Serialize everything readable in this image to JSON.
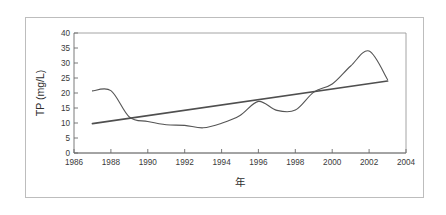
{
  "figure": {
    "frame_color": "#bdbdbd",
    "background": "#ffffff"
  },
  "chart_data": {
    "type": "line",
    "title": "",
    "subtitle": "",
    "xlabel": "年",
    "ylabel": "TP (mg/L)",
    "xlim": [
      1986,
      2004
    ],
    "ylim": [
      0,
      40
    ],
    "xticks": [
      1986,
      1988,
      1990,
      1992,
      1994,
      1996,
      1998,
      2000,
      2002,
      2004
    ],
    "xtick_labels": [
      "1986",
      "1988",
      "1990",
      "1992",
      "1994",
      "1996",
      "1998",
      "2000",
      "2002",
      "2004"
    ],
    "yticks": [
      0,
      5,
      10,
      15,
      20,
      25,
      30,
      35,
      40
    ],
    "ytick_labels": [
      "0",
      "5",
      "10",
      "15",
      "20",
      "25",
      "30",
      "35",
      "40"
    ],
    "grid": false,
    "legend": null,
    "legend_position": "none",
    "annotations": [],
    "series": [
      {
        "name": "TP measured",
        "type": "line",
        "color": "#555555",
        "x": [
          1987,
          1988,
          1989,
          1990,
          1991,
          1992,
          1993,
          1994,
          1995,
          1996,
          1997,
          1998,
          1999,
          2000,
          2001,
          2002,
          2003
        ],
        "values": [
          20.7,
          20.8,
          12.0,
          10.5,
          9.4,
          9.2,
          8.4,
          9.9,
          12.5,
          17.2,
          14.2,
          14.3,
          20.3,
          23.0,
          29.0,
          34.0,
          24.5
        ]
      },
      {
        "name": "Linear trend",
        "type": "line",
        "color": "#4f4f4f",
        "x": [
          1987,
          2003
        ],
        "values": [
          9.8,
          24.0
        ]
      }
    ]
  }
}
